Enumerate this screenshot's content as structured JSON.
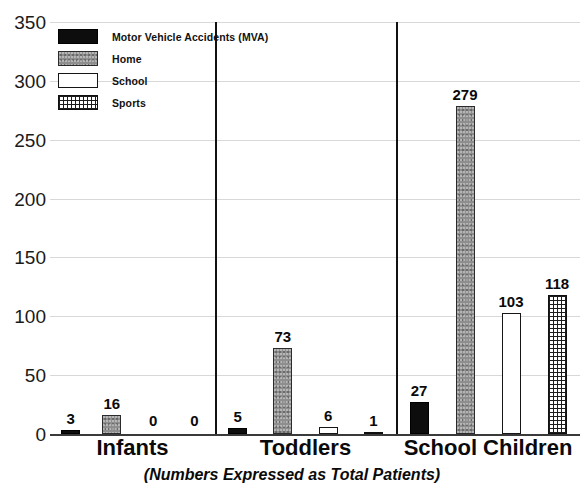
{
  "chart_data": {
    "type": "bar",
    "title": "",
    "subtitle": "",
    "caption": "(Numbers Expressed as Total Patients)",
    "xlabel": "",
    "ylabel": "",
    "ylim": [
      0,
      350
    ],
    "ytick_step": 50,
    "yticks": [
      "350",
      "300",
      "250",
      "200",
      "150",
      "100",
      "50",
      "0"
    ],
    "grid": true,
    "legend_position": "top-left",
    "categories": [
      "Infants",
      "Toddlers",
      "School Children"
    ],
    "series": [
      {
        "name": "Motor Vehicle Accidents (MVA)",
        "key": "mva",
        "color": "#0d0d0d",
        "values": [
          3,
          5,
          27
        ]
      },
      {
        "name": "Home",
        "key": "home",
        "color": "#8e8e8e",
        "values": [
          16,
          73,
          279
        ]
      },
      {
        "name": "School",
        "key": "school",
        "color": "#ffffff",
        "values": [
          0,
          6,
          103
        ]
      },
      {
        "name": "Sports",
        "key": "sports",
        "color": "#ffffff",
        "values": [
          0,
          1,
          118
        ]
      }
    ]
  },
  "legend": {
    "items": [
      {
        "label": "Motor Vehicle Accidents (MVA)",
        "swatch": "mva"
      },
      {
        "label": "Home",
        "swatch": "home"
      },
      {
        "label": "School",
        "swatch": "school"
      },
      {
        "label": "Sports",
        "swatch": "sports"
      }
    ]
  },
  "axis": {
    "yticks": [
      "350",
      "300",
      "250",
      "200",
      "150",
      "100",
      "50",
      "0"
    ]
  },
  "caption": {
    "text": "(Numbers Expressed as Total Patients)"
  }
}
